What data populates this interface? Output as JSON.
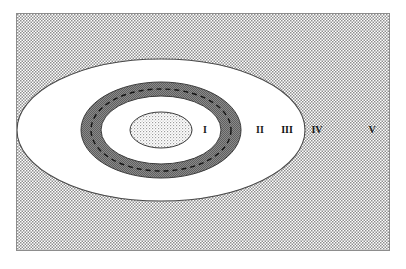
{
  "figure": {
    "frame": {
      "border_color": "#8d8d8d",
      "background_color": "#ffffff"
    }
  },
  "scan_artifacts": {
    "top_line_1": "",
    "top_line_2": "",
    "bottom_line": ""
  },
  "colors": {
    "background_dither": "#9a9a9a",
    "dark_ring": "#6f6f6f",
    "white_band": "#ffffff",
    "inner_dither": "#b4b4b4",
    "outline": "#3a3a3a",
    "dashed_line": "#1f1f1f",
    "label_text": "#1a1a1a"
  },
  "zones": [
    {
      "id": "zone-1",
      "label": "I",
      "fill": "light-dither",
      "label_x": 188,
      "label_y": 116,
      "rx": 31,
      "ry": 18
    },
    {
      "id": "zone-2",
      "label": "II",
      "fill": "white",
      "label_x": 243,
      "label_y": 116,
      "rx": 60,
      "ry": 34
    },
    {
      "id": "zone-3",
      "label": "III",
      "fill": "dark-dither",
      "label_x": 270,
      "label_y": 116,
      "rx": 80,
      "ry": 48
    },
    {
      "id": "zone-4",
      "label": "IV",
      "fill": "white",
      "label_x": 300,
      "label_y": 116,
      "rx": 144,
      "ry": 71
    },
    {
      "id": "zone-5",
      "label": "V",
      "fill": "background-dither",
      "label_x": 355,
      "label_y": 116,
      "rx": 0,
      "ry": 0
    }
  ],
  "geometry": {
    "center_x": 144,
    "center_y": 116,
    "dashed_ring": {
      "rx": 70,
      "ry": 41
    }
  }
}
